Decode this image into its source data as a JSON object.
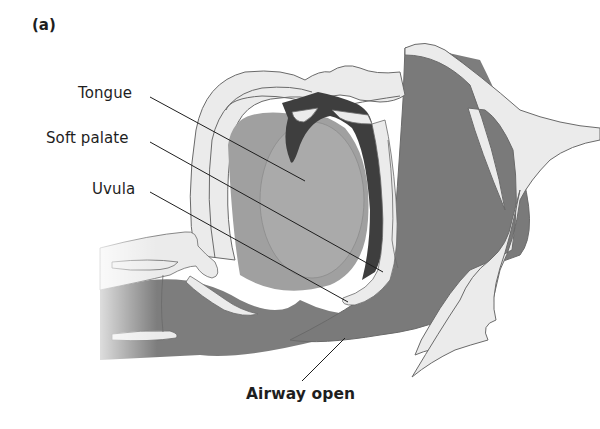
{
  "figure": {
    "panel_label": "(a)",
    "labels": {
      "tongue": "Tongue",
      "soft_palate": "Soft palate",
      "uvula": "Uvula",
      "airway": "Airway open"
    },
    "colors": {
      "background": "#ffffff",
      "light_tissue": "#ebebeb",
      "mid_tissue": "#a8a8a8",
      "tongue_fill": "#a0a0a0",
      "airway_fill": "#7d7d7d",
      "dark_cavity": "#3e3e3e",
      "outline": "#6a6a6a",
      "leader_line": "#1e1e1e"
    }
  }
}
